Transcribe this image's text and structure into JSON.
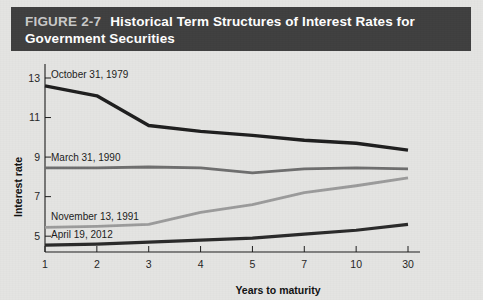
{
  "title_bar": {
    "figure_number": "FIGURE 2-7",
    "line1": "Historical Term Structures of Interest Rates for",
    "line2": "Government Securities",
    "background_color": "#3f3f3f",
    "text_color": "#ffffff"
  },
  "chart_data": {
    "type": "line",
    "title": "Historical Term Structures of Interest Rates for Government Securities",
    "xlabel": "Years to maturity",
    "ylabel": "Interest rate",
    "categories": [
      "1",
      "2",
      "3",
      "4",
      "5",
      "7",
      "10",
      "30"
    ],
    "x_tick_labels": [
      "1",
      "2",
      "3",
      "4",
      "5",
      "7",
      "10",
      "30"
    ],
    "y_tick_labels": [
      "5",
      "7",
      "9",
      "11",
      "13"
    ],
    "ylim": [
      4.2,
      13.0
    ],
    "grid": false,
    "legend_position": "inline-labels",
    "series": [
      {
        "name": "October 31, 1979",
        "color": "#1e1e1e",
        "label_x_category": "1",
        "values": [
          12.6,
          12.1,
          10.6,
          10.3,
          10.1,
          9.85,
          9.7,
          9.35
        ]
      },
      {
        "name": "March 31, 1990",
        "color": "#6e6e6e",
        "label_x_category": "1",
        "values": [
          8.45,
          8.45,
          8.5,
          8.45,
          8.2,
          8.4,
          8.45,
          8.4
        ]
      },
      {
        "name": "November 13, 1991",
        "color": "#9b9b9b",
        "label_x_category": "1",
        "values": [
          5.45,
          5.5,
          5.6,
          6.2,
          6.6,
          7.2,
          7.55,
          7.95
        ]
      },
      {
        "name": "April 19, 2012",
        "color": "#2a2a2a",
        "label_x_category": "1",
        "values": [
          4.55,
          4.6,
          4.7,
          4.8,
          4.9,
          5.1,
          5.3,
          5.6
        ]
      }
    ]
  }
}
